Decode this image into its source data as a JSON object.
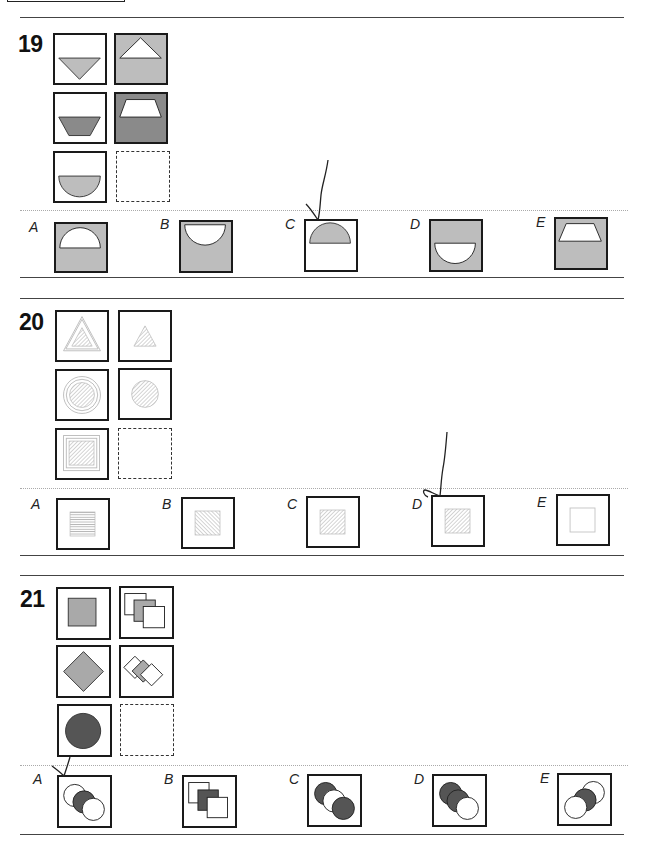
{
  "questions": [
    {
      "number": "19",
      "colors": {
        "light_gray": "#bdbdbd",
        "dark_gray": "#8a8a8a",
        "white": "#ffffff"
      },
      "grid": [
        {
          "pos": "r1c1",
          "shape": "inverted-triangle",
          "fill": "light_gray",
          "bg": "white"
        },
        {
          "pos": "r1c2",
          "shape": "triangle",
          "fill": "white",
          "bg": "light_gray"
        },
        {
          "pos": "r2c1",
          "shape": "inverted-trapezoid",
          "fill": "dark_gray",
          "bg": "white"
        },
        {
          "pos": "r2c2",
          "shape": "trapezoid",
          "fill": "white",
          "bg": "dark_gray"
        },
        {
          "pos": "r3c1",
          "shape": "bowl-semicircle",
          "fill": "light_gray",
          "bg": "white"
        },
        {
          "pos": "r3c2",
          "shape": "missing",
          "fill": "",
          "bg": "white"
        }
      ],
      "options": [
        {
          "label": "A",
          "shape": "dome-semicircle",
          "fill": "white",
          "bg": "light_gray"
        },
        {
          "label": "B",
          "shape": "bowl-semicircle-top",
          "fill": "white",
          "bg": "light_gray"
        },
        {
          "label": "C",
          "shape": "dome-semicircle",
          "fill": "light_gray",
          "bg": "white",
          "marked": true
        },
        {
          "label": "D",
          "shape": "bowl-semicircle",
          "fill": "white",
          "bg": "light_gray"
        },
        {
          "label": "E",
          "shape": "trapezoid",
          "fill": "white",
          "bg": "light_gray"
        }
      ]
    },
    {
      "number": "20",
      "grid": [
        {
          "pos": "r1c1",
          "shape": "hatched-triangle-in-triangle-outline"
        },
        {
          "pos": "r1c2",
          "shape": "hatched-triangle"
        },
        {
          "pos": "r2c1",
          "shape": "hatched-circle-in-circle-outline"
        },
        {
          "pos": "r2c2",
          "shape": "hatched-circle"
        },
        {
          "pos": "r3c1",
          "shape": "hatched-square-in-square-outline"
        },
        {
          "pos": "r3c2",
          "shape": "missing"
        }
      ],
      "options": [
        {
          "label": "A",
          "shape": "horizontal-lined-square"
        },
        {
          "label": "B",
          "shape": "backslash-hatched-square"
        },
        {
          "label": "C",
          "shape": "hatched-square"
        },
        {
          "label": "D",
          "shape": "hatched-square",
          "marked": true
        },
        {
          "label": "E",
          "shape": "outline-square"
        }
      ]
    },
    {
      "number": "21",
      "colors": {
        "mid_gray": "#a9a9a9",
        "dark_gray": "#555555"
      },
      "grid": [
        {
          "pos": "r1c1",
          "shape": "gray-square"
        },
        {
          "pos": "r1c2",
          "shape": "three-overlapping-squares-gray-middle"
        },
        {
          "pos": "r2c1",
          "shape": "gray-diamond"
        },
        {
          "pos": "r2c2",
          "shape": "three-overlapping-diamonds-gray-middle"
        },
        {
          "pos": "r3c1",
          "shape": "dark-circle"
        },
        {
          "pos": "r3c2",
          "shape": "missing"
        }
      ],
      "options": [
        {
          "label": "A",
          "shape": "three-circles-dark-middle",
          "marked": true
        },
        {
          "label": "B",
          "shape": "three-squares-dark-middle"
        },
        {
          "label": "C",
          "shape": "three-circles-white-middle"
        },
        {
          "label": "D",
          "shape": "three-circles-white-front"
        },
        {
          "label": "E",
          "shape": "three-circles-reversed-dark-middle"
        }
      ]
    }
  ]
}
